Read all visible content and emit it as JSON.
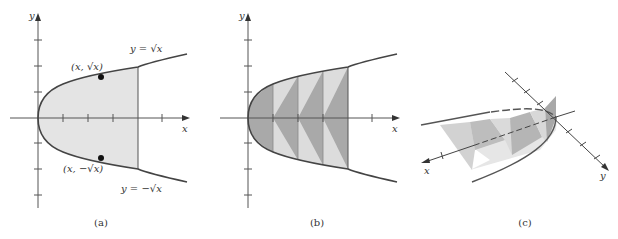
{
  "panels": [
    {
      "id": "a",
      "caption": "(a)",
      "x_axis_label": "x",
      "y_axis_label": "y",
      "curve_upper_label": "y = √x",
      "curve_lower_label": "y = −√x",
      "point_upper_label": "(x, √x)",
      "point_lower_label": "(x, −√x)"
    },
    {
      "id": "b",
      "caption": "(b)",
      "x_axis_label": "x",
      "y_axis_label": "y"
    },
    {
      "id": "c",
      "caption": "(c)",
      "x_axis_label": "x",
      "y_axis_label": "y"
    }
  ],
  "colors": {
    "curve": "#444444",
    "axis": "#555555",
    "region_fill": "#e4e4e4",
    "triangle_dark": "#a9a9a9",
    "triangle_light": "#dcdcdc",
    "point": "#111111"
  }
}
